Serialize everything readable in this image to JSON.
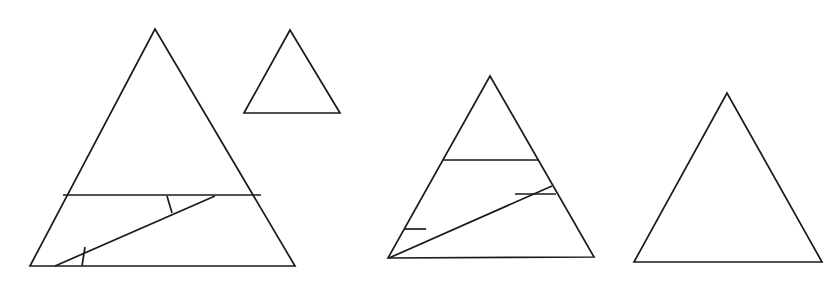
{
  "document": {
    "title": "Triangle Figures",
    "background_color": "#ffffff",
    "stroke_color": "#1a1a1a",
    "stroke_width": 1.7,
    "width": 831,
    "height": 284,
    "figure_count": 4
  },
  "figures": [
    {
      "id": "figure-1",
      "name": "large-subdivided-triangle",
      "label": "Large triangle with subdivided base band",
      "outline": "30,266 155,29 295,266",
      "apex": {
        "x": 155,
        "y": 29
      },
      "base_left": {
        "x": 30,
        "y": 266
      },
      "base_right": {
        "x": 295,
        "y": 266
      },
      "interior_lines": [
        {
          "name": "upper-horizontal-chord",
          "points": "63,195 261,195"
        },
        {
          "name": "long-diagonal",
          "points": "55,266 215,196"
        },
        {
          "name": "short-vertical-tick",
          "points": "167,196 172,213"
        },
        {
          "name": "short-lower-tick",
          "points": "85,247 82,266"
        }
      ]
    },
    {
      "id": "figure-2",
      "name": "small-plain-triangle",
      "label": "Small plain triangle",
      "outline": "244,113 290,30 340,113",
      "apex": {
        "x": 290,
        "y": 30
      },
      "base_left": {
        "x": 244,
        "y": 113
      },
      "base_right": {
        "x": 340,
        "y": 113
      },
      "interior_lines": []
    },
    {
      "id": "figure-3",
      "name": "medium-subdivided-triangle",
      "label": "Medium triangle with subdivided base band",
      "outline": "388,258 490,76 594,257",
      "apex": {
        "x": 490,
        "y": 76
      },
      "base_left": {
        "x": 388,
        "y": 258
      },
      "base_right": {
        "x": 594,
        "y": 257
      },
      "interior_lines": [
        {
          "name": "upper-horizontal-chord",
          "points": "443,160 538,160"
        },
        {
          "name": "long-diagonal",
          "points": "389,258 552,186"
        },
        {
          "name": "mid-horizontal-chord",
          "points": "515,194 556,194"
        },
        {
          "name": "short-lower-chord",
          "points": "404,229 426,229"
        }
      ]
    },
    {
      "id": "figure-4",
      "name": "right-plain-triangle",
      "label": "Plain triangle",
      "outline": "634,262 727,93 822,262",
      "apex": {
        "x": 727,
        "y": 93
      },
      "base_left": {
        "x": 634,
        "y": 262
      },
      "base_right": {
        "x": 822,
        "y": 262
      },
      "interior_lines": []
    }
  ]
}
